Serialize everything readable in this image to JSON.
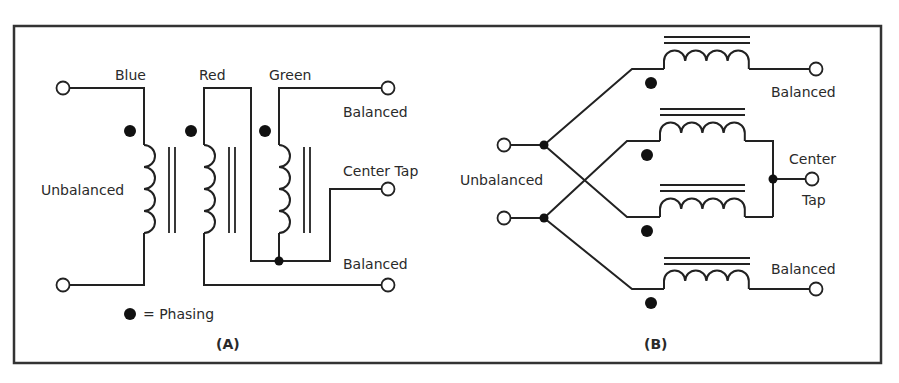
{
  "figure": {
    "frame_color": "#333333",
    "line_color": "#222222",
    "background": "#ffffff"
  },
  "panel_a": {
    "caption": "(A)",
    "winding_labels": {
      "blue": "Blue",
      "red": "Red",
      "green": "Green"
    },
    "terminal_labels": {
      "unbalanced": "Unbalanced",
      "balanced_top": "Balanced",
      "center_tap": "Center Tap",
      "balanced_bottom": "Balanced"
    },
    "legend": {
      "symbol": "dot",
      "text": "= Phasing"
    }
  },
  "panel_b": {
    "caption": "(B)",
    "terminal_labels": {
      "unbalanced": "Unbalanced",
      "balanced_top": "Balanced",
      "center_tap_line1": "Center",
      "center_tap_line2": "Tap",
      "balanced_bottom": "Balanced"
    },
    "coil_count": 4
  }
}
